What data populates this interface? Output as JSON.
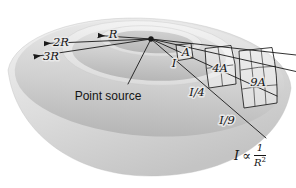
{
  "figure": {
    "labels": {
      "radius_r": "R",
      "radius_2r": "2R",
      "radius_3r": "3R",
      "point_source": "Point source",
      "area_a": "A",
      "area_4a": "4A",
      "area_9a": "9A",
      "intensity_full": "I",
      "intensity_quarter": "I/4",
      "intensity_ninth": "I/9"
    },
    "formula": {
      "lhs": "I",
      "relation": "∝",
      "numerator": "1",
      "denominator_base": "R",
      "denominator_exponent": "2"
    },
    "colors": {
      "bg": "#ffffff",
      "bowl_highlight": "#f2f2f2",
      "bowl_mid": "#dddddd",
      "bowl_shadow": "#c4c4c4",
      "interior_light": "#eaeaea",
      "interior_mid": "#d0d0d0",
      "interior_dark": "#b6b6b6",
      "band_light": "#f3f3f3",
      "band_dark": "#dcdcdc",
      "line": "#1a1a1a",
      "text": "#141414",
      "patch_fill": "rgba(255,255,255,0.4)"
    }
  }
}
